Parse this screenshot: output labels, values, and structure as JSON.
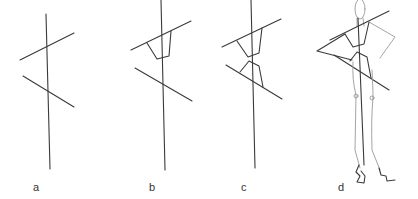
{
  "figure": {
    "panels": [
      {
        "label": "a",
        "description": "vertical balance line with shoulder and hip lines"
      },
      {
        "label": "b",
        "description": "balance line with shoulder line and upper torso block"
      },
      {
        "label": "c",
        "description": "balance line with shoulder and hip lines and upper/lower torso blocks"
      },
      {
        "label": "d",
        "description": "fashion figure sketch built over the construction lines"
      }
    ]
  },
  "colors": {
    "line": "#3a3a3a",
    "light_line": "#9a9a9a",
    "background": "#ffffff"
  }
}
